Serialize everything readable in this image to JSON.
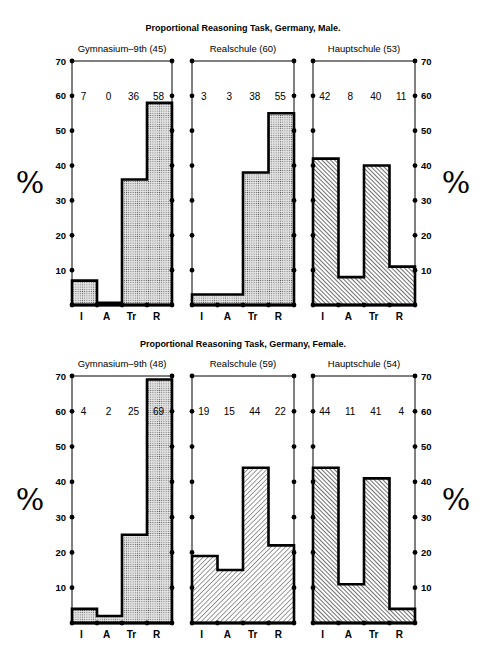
{
  "chart_data": [
    {
      "type": "bar",
      "title": "Proportional Reasoning Task, Germany, Male.",
      "ylabel": "%",
      "ylim": [
        0,
        70
      ],
      "yticks": [
        10,
        20,
        30,
        40,
        50,
        60,
        70
      ],
      "categories": [
        "I",
        "A",
        "Tr",
        "R"
      ],
      "panels": [
        {
          "name": "Gymnasium–9th (45)",
          "values": [
            7,
            0,
            36,
            58
          ],
          "fill": "dotted"
        },
        {
          "name": "Realschule (60)",
          "values": [
            3,
            3,
            38,
            55
          ],
          "fill": "dotted"
        },
        {
          "name": "Hauptschule (53)",
          "values": [
            42,
            8,
            40,
            11
          ],
          "fill": "hatched-backslash"
        }
      ]
    },
    {
      "type": "bar",
      "title": "Proportional Reasoning Task, Germany, Female.",
      "ylabel": "%",
      "ylim": [
        0,
        70
      ],
      "yticks": [
        10,
        20,
        30,
        40,
        50,
        60,
        70
      ],
      "categories": [
        "I",
        "A",
        "Tr",
        "R"
      ],
      "panels": [
        {
          "name": "Gymnasium–9th (48)",
          "values": [
            4,
            2,
            25,
            69
          ],
          "fill": "dotted"
        },
        {
          "name": "Realschule (59)",
          "values": [
            19,
            15,
            44,
            22
          ],
          "fill": "hatched-slash"
        },
        {
          "name": "Hauptschule (54)",
          "values": [
            44,
            11,
            41,
            4
          ],
          "fill": "hatched-backslash"
        }
      ]
    }
  ],
  "labels": {
    "male_title": "Proportional Reasoning Task, Germany, Male.",
    "female_title": "Proportional Reasoning Task, Germany, Female.",
    "percent": "%"
  }
}
